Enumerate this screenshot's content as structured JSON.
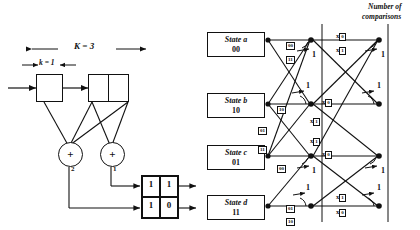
{
  "figure": {
    "title_right": {
      "line1": "Number of",
      "line2": "comparisons"
    }
  },
  "encoder": {
    "constraint_label": "K = 3",
    "input_label": "k = 1",
    "adders": [
      {
        "name": "adder-2",
        "symbol": "+",
        "label": "2"
      },
      {
        "name": "adder-1",
        "symbol": "+",
        "label": "1"
      }
    ],
    "output_matrix": {
      "rows": [
        [
          "1",
          "1"
        ],
        [
          "1",
          "0"
        ]
      ]
    }
  },
  "trellis": {
    "states": [
      {
        "name": "State a",
        "bits": "00"
      },
      {
        "name": "State b",
        "bits": "10"
      },
      {
        "name": "State c",
        "bits": "01"
      },
      {
        "name": "State d",
        "bits": "11"
      }
    ],
    "stage1_branch_labels": [
      {
        "id": "a-out-upper",
        "value": "00"
      },
      {
        "id": "a-out-lower",
        "value": "11"
      },
      {
        "id": "b-out-upper",
        "value": "10"
      },
      {
        "id": "b-out-lower",
        "value": "01"
      },
      {
        "id": "c-out-upper",
        "value": "11"
      },
      {
        "id": "c-out-lower",
        "value": "00"
      },
      {
        "id": "d-out-upper",
        "value": "01"
      },
      {
        "id": "d-out-lower",
        "value": "10"
      }
    ],
    "stage2_metric_labels": [
      {
        "id": "m-a-top",
        "prefix": "x",
        "value": "0"
      },
      {
        "id": "m-a-bot",
        "prefix": "x",
        "value": "1"
      },
      {
        "id": "m-b-top",
        "prefix": "x",
        "value": "0"
      },
      {
        "id": "m-b-bot",
        "prefix": "x",
        "value": "1"
      },
      {
        "id": "m-c-top",
        "prefix": "x",
        "value": "1"
      },
      {
        "id": "m-c-bot",
        "prefix": "x",
        "value": "0"
      },
      {
        "id": "m-d-top",
        "prefix": "x",
        "value": "1"
      },
      {
        "id": "m-d-bot",
        "prefix": "x",
        "value": "0"
      }
    ],
    "comparison_counts": [
      {
        "id": "cmp-s1-a",
        "value": "1"
      },
      {
        "id": "cmp-s1-b",
        "value": "1"
      },
      {
        "id": "cmp-s1-c",
        "value": "1"
      },
      {
        "id": "cmp-s1-d",
        "value": "1"
      },
      {
        "id": "cmp-s2-a",
        "value": "1"
      },
      {
        "id": "cmp-s2-b",
        "value": "1"
      },
      {
        "id": "cmp-s2-c",
        "value": "1"
      },
      {
        "id": "cmp-s2-d",
        "value": "1"
      }
    ]
  }
}
